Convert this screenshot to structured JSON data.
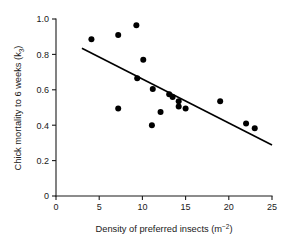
{
  "chart_data": {
    "type": "scatter",
    "title": "",
    "xlabel": "Density of preferred insects (m−2)",
    "xlabel_text": "Density of preferred insects (m",
    "xlabel_sup": "−2",
    "xlabel_tail": ")",
    "ylabel": "Chick mortality to 6 weeks (k3)",
    "ylabel_text": "Chick mortality to 6 weeks (k",
    "ylabel_sub": "3",
    "ylabel_tail": ")",
    "xlim": [
      0,
      25
    ],
    "ylim": [
      0,
      1.0
    ],
    "xticks": [
      0,
      5,
      10,
      15,
      20,
      25
    ],
    "xtick_labels": [
      "0",
      "5",
      "10",
      "15",
      "20",
      "25"
    ],
    "yticks": [
      0,
      0.2,
      0.4,
      0.6,
      0.8,
      1.0
    ],
    "ytick_labels": [
      "0",
      "0.2",
      "0.4",
      "0.6",
      "0.8",
      "1.0"
    ],
    "grid": false,
    "legend": "none",
    "marker": "filled-circle",
    "marker_color": "#000000",
    "line_color": "#000000",
    "points": [
      {
        "x": 4.1,
        "y": 0.885
      },
      {
        "x": 7.2,
        "y": 0.91
      },
      {
        "x": 9.3,
        "y": 0.965
      },
      {
        "x": 10.1,
        "y": 0.77
      },
      {
        "x": 9.4,
        "y": 0.665
      },
      {
        "x": 11.2,
        "y": 0.605
      },
      {
        "x": 13.1,
        "y": 0.575
      },
      {
        "x": 13.5,
        "y": 0.56
      },
      {
        "x": 14.2,
        "y": 0.535
      },
      {
        "x": 14.2,
        "y": 0.505
      },
      {
        "x": 15.0,
        "y": 0.495
      },
      {
        "x": 12.1,
        "y": 0.475
      },
      {
        "x": 7.2,
        "y": 0.495
      },
      {
        "x": 11.1,
        "y": 0.4
      },
      {
        "x": 19.0,
        "y": 0.535
      },
      {
        "x": 22.0,
        "y": 0.41
      },
      {
        "x": 23.0,
        "y": 0.383
      }
    ],
    "fit_line": {
      "x0": 3.0,
      "y0": 0.835,
      "x1": 25.0,
      "y1": 0.288
    }
  }
}
